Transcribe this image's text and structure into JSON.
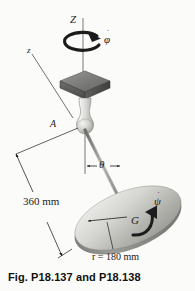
{
  "figure": {
    "caption": "Fig. P18.137 and P18.138",
    "axes": {
      "vertical_fixed_label": "Z",
      "body_axis_label": "z"
    },
    "points": {
      "support_label": "A",
      "center_of_mass_label": "G"
    },
    "angles": {
      "nutation_label": "θ"
    },
    "rates": {
      "precession_label": "φ",
      "precession_dot": "˙",
      "spin_label": "ψ",
      "spin_dot": "˙"
    },
    "dimensions": {
      "rod_length": "360 mm",
      "disk_radius": "r = 180 mm"
    },
    "colors": {
      "background": "#fbfbfa",
      "ink": "#1c1c1c",
      "plate_top": "#8d8d8d",
      "plate_side": "#5c5c5c",
      "bulb_light": "#e8e8e6",
      "bulb_mid": "#b5b5b2",
      "disk_light": "#e3e3e0",
      "disk_mid": "#b8b8b4",
      "disk_edge": "#8f8f8b",
      "rod": "#9a9a96"
    }
  }
}
